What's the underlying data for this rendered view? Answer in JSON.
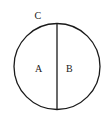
{
  "diagram": {
    "labels": {
      "point_c": "C",
      "region_a": "A",
      "region_b": "B"
    },
    "circle": {
      "cx": 57,
      "cy": 66.5,
      "r": 43
    },
    "diameter": {
      "x": 57,
      "y1": 23.5,
      "y2": 109.5
    },
    "colors": {
      "stroke": "#1a1a1a",
      "background": "#ffffff"
    }
  }
}
